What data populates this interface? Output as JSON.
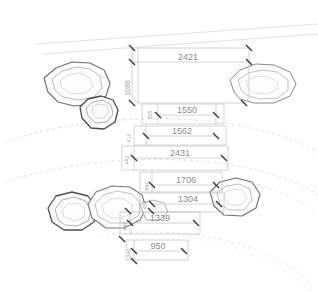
{
  "drawing": {
    "title": "site-plan-boulder-layout",
    "units": "mm",
    "background_color": "#ffffff",
    "dimension_line_color": "#b8b8b8",
    "dimension_text_color": "#8d8d8d",
    "boulder_outline_color": "#6e6e6e",
    "boulder_inner_color": "#a8a8a8",
    "contour_color": "#d8cfc8",
    "boundary_color": "#d5d5d5"
  },
  "dimensions": {
    "horizontal": [
      {
        "id": "dim-2421",
        "label": "2421",
        "x": 188,
        "y": 57,
        "line_y": 62,
        "x1": 132,
        "x2": 249
      },
      {
        "id": "dim-1550",
        "label": "1550",
        "x": 185,
        "y": 110,
        "line_y": 115,
        "x1": 158,
        "x2": 216
      },
      {
        "id": "dim-1562",
        "label": "1562",
        "x": 180,
        "y": 131,
        "line_y": 136,
        "x1": 146,
        "x2": 216
      },
      {
        "id": "dim-2431",
        "label": "2431",
        "x": 178,
        "y": 153,
        "line_y": 158,
        "x1": 134,
        "x2": 224
      },
      {
        "id": "dim-1706",
        "label": "1706",
        "x": 183,
        "y": 180,
        "line_y": 185,
        "x1": 152,
        "x2": 216
      },
      {
        "id": "dim-1304",
        "label": "1304",
        "x": 184,
        "y": 199,
        "line_y": 204,
        "x1": 152,
        "x2": 219
      },
      {
        "id": "dim-1339",
        "label": "1339",
        "x": 158,
        "y": 218,
        "line_y": 223,
        "x1": 130,
        "x2": 196
      },
      {
        "id": "dim-950",
        "label": "950",
        "x": 158,
        "y": 246,
        "line_y": 251,
        "x1": 134,
        "x2": 184
      }
    ],
    "vertical": [
      {
        "id": "dim-v-1086",
        "label": "1086",
        "x": 128,
        "y": 80
      },
      {
        "id": "dim-v-442",
        "label": "442",
        "x": 128,
        "y": 152
      },
      {
        "id": "dim-v-414",
        "label": "414",
        "x": 130,
        "y": 128
      },
      {
        "id": "dim-v-684",
        "label": "684",
        "x": 150,
        "y": 180
      },
      {
        "id": "dim-v-305",
        "label": "305",
        "x": 153,
        "y": 110
      },
      {
        "id": "dim-v-406",
        "label": "406",
        "x": 148,
        "y": 200
      },
      {
        "id": "dim-v-460",
        "label": "460",
        "x": 128,
        "y": 218
      },
      {
        "id": "dim-v-240",
        "label": "240",
        "x": 132,
        "y": 246
      }
    ]
  },
  "features": {
    "boulders": [
      {
        "id": "boulder-upper-left-large",
        "label": "rock-outline"
      },
      {
        "id": "boulder-upper-left-small",
        "label": "rock-outline"
      },
      {
        "id": "boulder-upper-right",
        "label": "rock-outline"
      },
      {
        "id": "boulder-lower-left-small",
        "label": "rock-outline"
      },
      {
        "id": "boulder-lower-left-large",
        "label": "rock-outline"
      },
      {
        "id": "boulder-lower-right",
        "label": "rock-outline"
      }
    ],
    "contours": [
      {
        "id": "contour-top-1"
      },
      {
        "id": "contour-top-2"
      },
      {
        "id": "contour-mid-1"
      },
      {
        "id": "contour-mid-2"
      },
      {
        "id": "contour-bottom-1"
      },
      {
        "id": "contour-bottom-2"
      }
    ]
  }
}
